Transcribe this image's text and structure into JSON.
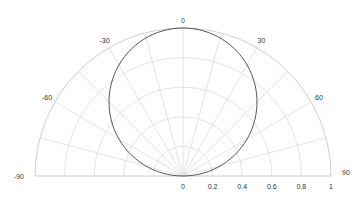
{
  "chart_data": {
    "type": "line",
    "subtype": "polar",
    "title": "",
    "theta_zero_location": "top",
    "theta_direction": "clockwise",
    "theta_range": [
      -90,
      90
    ],
    "theta_ticks": [
      -90,
      -60,
      -30,
      0,
      30,
      60,
      90
    ],
    "theta_tick_labels": [
      "-90",
      "-60",
      "-30",
      "0",
      "30",
      "60",
      "90"
    ],
    "r_range": [
      0,
      1
    ],
    "r_ticks": [
      0,
      0.2,
      0.4,
      0.6,
      0.8,
      1
    ],
    "r_tick_labels": [
      "0",
      "0.2",
      "0.4",
      "0.6",
      "0.8",
      "1"
    ],
    "grid": true,
    "legend": null,
    "series": [
      {
        "name": "r = cos(theta)",
        "color": "#555555",
        "theta_deg": [
          -90,
          -75,
          -60,
          -45,
          -30,
          -15,
          0,
          15,
          30,
          45,
          60,
          75,
          90
        ],
        "r": [
          0,
          0.259,
          0.5,
          0.707,
          0.866,
          0.966,
          1,
          0.966,
          0.866,
          0.707,
          0.5,
          0.259,
          0
        ]
      }
    ]
  },
  "colors": {
    "grid": "#dcdcdc",
    "outer": "#c8c8c8",
    "series": "#555555",
    "label": "#333333"
  }
}
